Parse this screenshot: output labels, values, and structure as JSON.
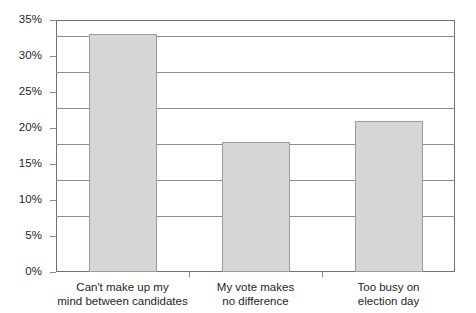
{
  "chart_data": {
    "type": "bar",
    "title": "",
    "subtitle": "",
    "xlabel": "",
    "ylabel": "",
    "categories": [
      "Can't make up my mind between candidates",
      "My vote makes no difference",
      "Too busy on election day"
    ],
    "category_lines": [
      [
        "Can't make up my",
        "mind between candidates"
      ],
      [
        "My vote makes",
        "no difference"
      ],
      [
        "Too busy on",
        "election day"
      ]
    ],
    "values": [
      33,
      18,
      21
    ],
    "value_labels": [
      "33%",
      "18%",
      "21%"
    ],
    "ylim": [
      0,
      35
    ],
    "ytick_values": [
      0,
      5,
      10,
      15,
      20,
      25,
      30,
      35
    ],
    "ytick_labels": [
      "0%",
      "5%",
      "10%",
      "15%",
      "20%",
      "25%",
      "30%",
      "35%"
    ],
    "grid": true,
    "grid_axis": "y",
    "legend": false,
    "legend_position": "none",
    "bar_fill": "#d6d6d6",
    "bar_border": "#9b9c9e",
    "axis_color": "#6f7072",
    "grid_color": "#8a8c8e",
    "background": "#ffffff",
    "text_color": "#231f20"
  }
}
